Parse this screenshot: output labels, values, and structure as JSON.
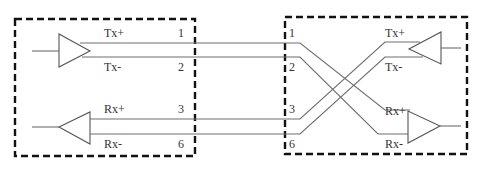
{
  "diagram": {
    "type": "ethernet-crossover-wiring",
    "left_device": {
      "signals": [
        {
          "label": "Tx+",
          "pin": "1"
        },
        {
          "label": "Tx-",
          "pin": "2"
        },
        {
          "label": "Rx+",
          "pin": "3"
        },
        {
          "label": "Rx-",
          "pin": "6"
        }
      ],
      "drivers": [
        {
          "name": "transmitter",
          "direction": "right"
        },
        {
          "name": "receiver",
          "direction": "left"
        }
      ]
    },
    "right_device": {
      "pins": [
        "1",
        "2",
        "3",
        "6"
      ],
      "signals": [
        {
          "label": "Tx+"
        },
        {
          "label": "Tx-"
        },
        {
          "label": "Rx+"
        },
        {
          "label": "Rx-"
        }
      ],
      "drivers": [
        {
          "name": "transmitter",
          "direction": "left"
        },
        {
          "name": "receiver",
          "direction": "right"
        }
      ]
    },
    "connections": [
      {
        "from": "left.1 Tx+",
        "to": "right.Rx+"
      },
      {
        "from": "left.2 Tx-",
        "to": "right.Rx-"
      },
      {
        "from": "left.3 Rx+",
        "to": "right.Tx+"
      },
      {
        "from": "left.6 Rx-",
        "to": "right.Tx-"
      }
    ],
    "colors": {
      "box_border": "#111111",
      "wire": "#6e6e6e",
      "text": "#333333"
    }
  }
}
